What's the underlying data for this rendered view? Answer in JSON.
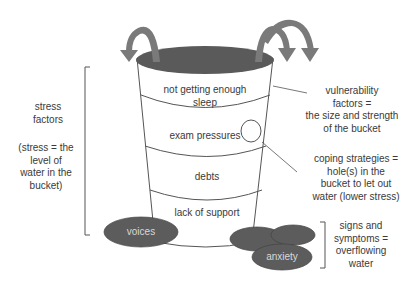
{
  "diagram": {
    "type": "stress bucket",
    "bucket_layers": [
      {
        "label": "not getting enough sleep",
        "line1": "not getting enough",
        "line2": "sleep"
      },
      {
        "label": "exam pressures"
      },
      {
        "label": "debts"
      },
      {
        "label": "lack of support"
      }
    ],
    "overflow_puddles": [
      {
        "label": "voices"
      },
      {
        "label": "anxiety"
      },
      {
        "label": ""
      },
      {
        "label": ""
      }
    ],
    "annotations": {
      "stress_factors": {
        "line1": "stress",
        "line2": "factors"
      },
      "stress_definition": {
        "line1": "(stress = the",
        "line2": "level of",
        "line3": "water in the",
        "line4": "bucket)"
      },
      "vulnerability": {
        "line1": "vulnerability",
        "line2": "factors =",
        "line3": "the size and strength",
        "line4": "of the bucket"
      },
      "coping": {
        "line1": "coping strategies =",
        "line2": "hole(s) in the",
        "line3": "bucket to let out",
        "line4": "water (lower stress)"
      },
      "signs": {
        "line1": "signs and",
        "line2": "symptoms =",
        "line3": "overflowing",
        "line4": "water"
      }
    },
    "colors": {
      "water": "#5a5a5a",
      "puddle": "#5c5c5c",
      "arrow": "#7a7a7a",
      "outline": "#555555",
      "text": "#3a3a3a"
    }
  }
}
